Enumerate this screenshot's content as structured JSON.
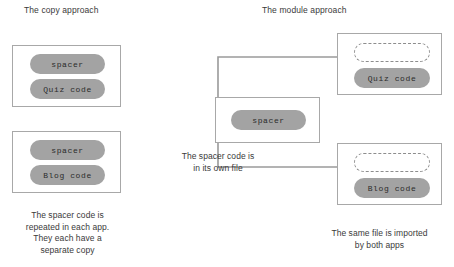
{
  "diagram": {
    "type": "concept-diagram",
    "left_title": "The copy approach",
    "right_title": "The module approach",
    "colors": {
      "pill_fill": "#a3a3a3",
      "box_border": "#a8a8a8",
      "connector": "#9a9a9a",
      "dashed_pill_border": "#8d8d8d",
      "text": "#3a3a3a",
      "background": "#ffffff"
    },
    "left": {
      "apps": [
        {
          "name": "quiz-app",
          "pills": [
            {
              "label": "spacer",
              "style": "solid"
            },
            {
              "label": "Quiz code",
              "style": "solid"
            }
          ]
        },
        {
          "name": "blog-app",
          "pills": [
            {
              "label": "spacer",
              "style": "solid"
            },
            {
              "label": "Blog code",
              "style": "solid"
            }
          ]
        }
      ],
      "caption": "The spacer code is repeated in each app. They each have a separate copy",
      "caption_lines": [
        "The spacer code is",
        "repeated in each app.",
        "They each have a",
        "separate copy"
      ]
    },
    "right": {
      "module": {
        "name": "spacer-module",
        "pills": [
          {
            "label": "spacer",
            "style": "solid"
          }
        ],
        "caption_lines": [
          "The spacer code is",
          "in its own file"
        ],
        "caption": "The spacer code is in its own file"
      },
      "apps": [
        {
          "name": "quiz-app",
          "pills": [
            {
              "label": "",
              "style": "dashed"
            },
            {
              "label": "Quiz code",
              "style": "solid"
            }
          ]
        },
        {
          "name": "blog-app",
          "pills": [
            {
              "label": "",
              "style": "dashed"
            },
            {
              "label": "Blog code",
              "style": "solid"
            }
          ]
        }
      ],
      "caption_lines": [
        "The same file is imported",
        "by both apps"
      ],
      "caption": "The same file is imported by both apps"
    },
    "connectors": [
      {
        "name": "spacer-to-quiz-app",
        "from": "spacer-module",
        "to": "quiz-app",
        "arrow": true
      },
      {
        "name": "spacer-to-blog-app",
        "from": "spacer-module",
        "to": "blog-app",
        "arrow": true
      }
    ]
  }
}
